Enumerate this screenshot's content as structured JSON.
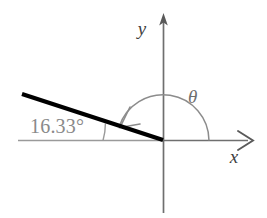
{
  "figure": {
    "type": "geometry-diagram",
    "background_color": "#ffffff",
    "width": 267,
    "height": 218
  },
  "axes": {
    "x_axis": {
      "label": "x",
      "label_x": 234,
      "label_y": 163,
      "color": "#6f6f6f",
      "start_x": 163,
      "start_y": 140,
      "end_x": 252,
      "end_y": 140,
      "arrow_style": "open-chevron"
    },
    "y_axis": {
      "label": "y",
      "label_x": 142,
      "label_y": 35,
      "color": "#6f6f6f",
      "top_x": 163,
      "top_y": 15,
      "bottom_x": 163,
      "bottom_y": 213,
      "arrow_style": "solid-triangle"
    },
    "origin": {
      "x": 163,
      "y": 140
    }
  },
  "reference_line": {
    "name": "horizontal-dashed-reference",
    "color": "#9a9a9a",
    "x1": 18,
    "y1": 140,
    "x2": 163,
    "y2": 140
  },
  "ray": {
    "name": "thick-ray",
    "color": "#000000",
    "stroke_width": 4.2,
    "x1": 22,
    "y1": 94,
    "x2": 163,
    "y2": 140
  },
  "angles": {
    "theta": {
      "symbol": "θ",
      "label_x": 188,
      "label_y": 103,
      "arc_color": "#8c8c8c",
      "arc_radius": 46,
      "start_deg": 0,
      "end_deg": 162,
      "sweep": "counterclockwise",
      "arrow_at_end": true
    },
    "elevation": {
      "value_text": "16.33°",
      "value_number": 16.33,
      "unit": "degrees",
      "label_x": 30,
      "label_y": 133,
      "text_color": "#8a8a8a",
      "arc_color": "#9a9a9a",
      "arc_radius": 60,
      "arc_start_deg": 0,
      "arc_end_deg": 16.33
    }
  }
}
